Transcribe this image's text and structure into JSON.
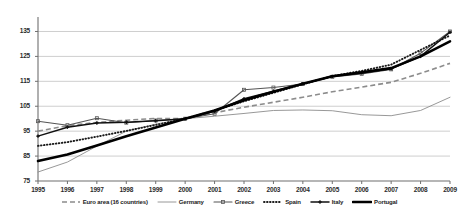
{
  "chart_data": {
    "type": "line",
    "title": "",
    "xlabel": "",
    "ylabel": "",
    "x": [
      1995,
      1996,
      1997,
      1998,
      1999,
      2000,
      2001,
      2002,
      2003,
      2004,
      2005,
      2006,
      2007,
      2008,
      2009
    ],
    "xlim": [
      1995,
      2009
    ],
    "ylim": [
      75,
      138
    ],
    "yticks": [
      75,
      85,
      95,
      105,
      115,
      125,
      135
    ],
    "xticks": [
      "1995",
      "1996",
      "1997",
      "1998",
      "1999",
      "2000",
      "2001",
      "2002",
      "2003",
      "2004",
      "2005",
      "2006",
      "2007",
      "2008",
      "2009"
    ],
    "grid": true,
    "legend_position": "bottom",
    "series": [
      {
        "name": "Euro area (16 countries)",
        "style": "dashed",
        "color": "#8c8c8c",
        "values": [
          95.0,
          97.2,
          98.5,
          99.4,
          100.1,
          100.0,
          102.4,
          104.6,
          106.6,
          108.6,
          110.8,
          112.7,
          114.6,
          118.2,
          122.2
        ]
      },
      {
        "name": "Germany",
        "style": "solid-thin",
        "color": "#8c8c8c",
        "values": [
          78.6,
          82.6,
          89.0,
          95.0,
          97.8,
          100.0,
          101.0,
          102.1,
          103.3,
          103.5,
          103.2,
          101.6,
          101.2,
          103.3,
          108.6
        ]
      },
      {
        "name": "Greece",
        "style": "solid-marker",
        "color": "#555555",
        "values": [
          99.0,
          97.4,
          100.2,
          98.4,
          99.3,
          100.0,
          102.0,
          111.6,
          112.5,
          113.9,
          116.8,
          118.0,
          119.8,
          126.3,
          135.0
        ]
      },
      {
        "name": "Spain",
        "style": "dotted",
        "color": "#1a1a1a",
        "values": [
          89.1,
          90.6,
          92.8,
          95.1,
          97.5,
          100.0,
          103.3,
          107.0,
          110.4,
          113.8,
          117.1,
          119.2,
          121.7,
          127.6,
          133.4
        ]
      },
      {
        "name": "Italy",
        "style": "solid-cross",
        "color": "#111111",
        "values": [
          93.0,
          96.6,
          98.3,
          98.6,
          99.2,
          100.0,
          103.0,
          108.0,
          111.0,
          114.0,
          117.0,
          118.4,
          120.0,
          125.0,
          134.7
        ]
      },
      {
        "name": "Portugal",
        "style": "solid-thick",
        "color": "#000000",
        "values": [
          83.0,
          85.6,
          89.2,
          93.0,
          96.5,
          100.0,
          103.3,
          107.4,
          110.8,
          114.0,
          117.0,
          118.6,
          120.3,
          125.0,
          131.0
        ]
      }
    ]
  },
  "axis": {
    "y_tick_labels": [
      "135",
      "125",
      "115",
      "105",
      "95",
      "85",
      "75"
    ],
    "x_tick_labels": [
      "1995",
      "1996",
      "1997",
      "1998",
      "1999",
      "2000",
      "2001",
      "2002",
      "2003",
      "2004",
      "2005",
      "2006",
      "2007",
      "2008",
      "2009"
    ]
  },
  "legend": {
    "items": [
      {
        "label": "Euro area (16 countries)"
      },
      {
        "label": "Germany"
      },
      {
        "label": "Greece"
      },
      {
        "label": "Spain"
      },
      {
        "label": "Italy"
      },
      {
        "label": "Portugal"
      }
    ]
  }
}
